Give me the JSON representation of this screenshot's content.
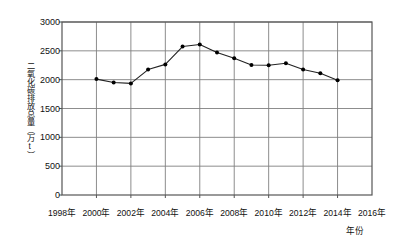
{
  "chart_data": {
    "type": "line",
    "title": "",
    "xlabel": "年份",
    "ylabel": "二氧化碳排放总量（万t）",
    "xlim": [
      1998,
      2016
    ],
    "ylim": [
      0,
      3000
    ],
    "grid": true,
    "legend": false,
    "y_ticks": [
      0,
      500,
      1000,
      1500,
      2000,
      2500,
      3000
    ],
    "y_tick_labels": [
      "0",
      "500",
      "1000",
      "1500",
      "2000",
      "2500",
      "3000"
    ],
    "x_ticks": [
      1998,
      2000,
      2002,
      2004,
      2006,
      2008,
      2010,
      2012,
      2014,
      2016
    ],
    "x_tick_labels": [
      "1998年",
      "2000年",
      "2002年",
      "2004年",
      "2006年",
      "2008年",
      "2010年",
      "2012年",
      "2014年",
      "2016年"
    ],
    "x": [
      2000,
      2001,
      2002,
      2003,
      2004,
      2005,
      2006,
      2007,
      2008,
      2009,
      2010,
      2011,
      2012,
      2013,
      2014
    ],
    "values": [
      2010,
      1950,
      1935,
      2175,
      2265,
      2575,
      2610,
      2470,
      2370,
      2255,
      2250,
      2285,
      2175,
      2110,
      1990
    ],
    "marker": "filled-circle",
    "line_color": "#222222",
    "marker_color": "#000000",
    "grid_color": "#808080",
    "frame_color": "#555555"
  },
  "axis": {
    "ylabel": "二氧化碳排放总量（万t）",
    "xlabel": "年份"
  }
}
